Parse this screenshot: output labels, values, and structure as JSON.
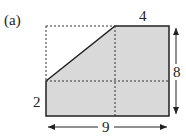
{
  "figure": {
    "label": "(a)",
    "shape": "pentagon formed by cutting top-left corner off a rectangle",
    "fill_color": "#d9d9d9",
    "stroke_color": "#222222",
    "dimensions": {
      "top": "4",
      "right": "8",
      "left": "2",
      "bottom": "9"
    }
  }
}
